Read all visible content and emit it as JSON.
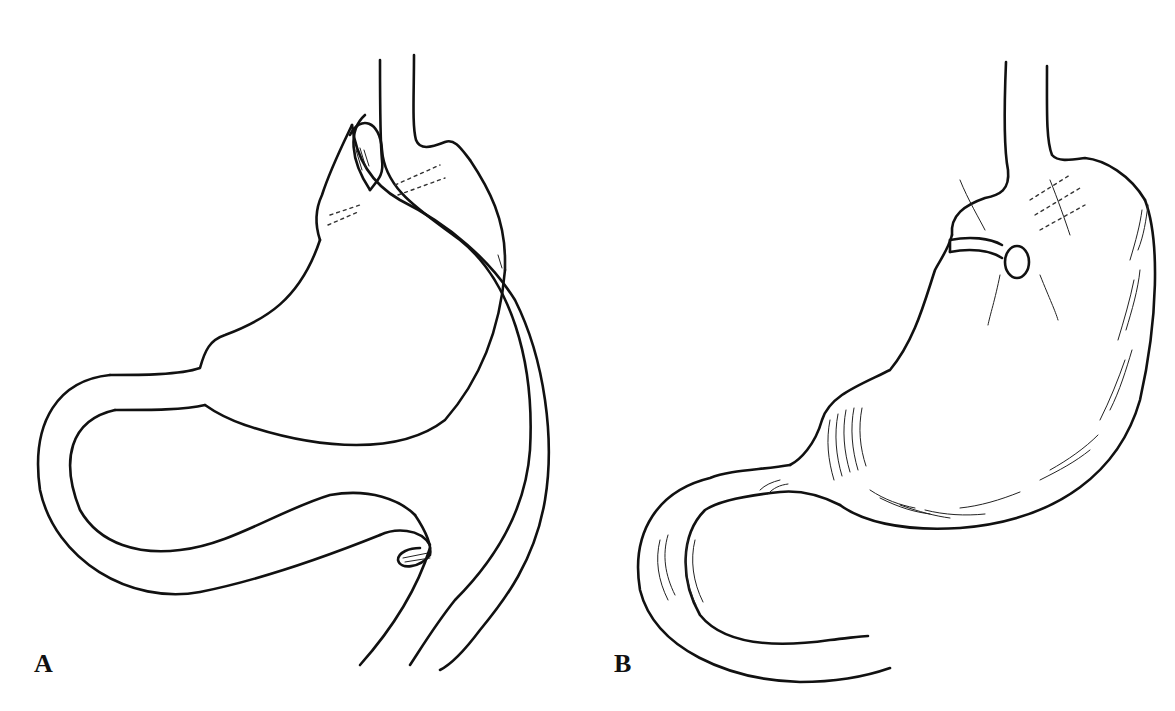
{
  "figure": {
    "panels": [
      {
        "id": "A",
        "label": "A",
        "description": "Stomach with tube passing over gastroesophageal junction"
      },
      {
        "id": "B",
        "label": "B",
        "description": "Stomach with gastrostomy tube inserted through opening"
      }
    ],
    "colors": {
      "ink": "#111111",
      "background": "#ffffff"
    }
  }
}
